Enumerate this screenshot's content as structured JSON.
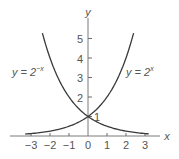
{
  "chart_data": {
    "type": "line",
    "title": "",
    "xlabel": "x",
    "ylabel": "y",
    "xlim": [
      -3.6,
      3.8
    ],
    "ylim": [
      0,
      6.2
    ],
    "grid": false,
    "legend": "inline labels",
    "x_ticks": [
      "-3",
      "-2",
      "-1",
      "0",
      "1",
      "2",
      "3"
    ],
    "y_ticks": [
      "1",
      "2",
      "3",
      "4",
      "5"
    ],
    "series": [
      {
        "name": "y = 2^x",
        "label_base": "y = 2",
        "label_exp": "x",
        "x": [
          -3.3,
          -3,
          -2,
          -1,
          0,
          1,
          2,
          2.4
        ],
        "y": [
          0.102,
          0.125,
          0.25,
          0.5,
          1,
          2,
          4,
          5.28
        ]
      },
      {
        "name": "y = 2^-x",
        "label_base": "y = 2",
        "label_exp": "−x",
        "x": [
          -2.4,
          -2,
          -1,
          0,
          1,
          2,
          3,
          3.2
        ],
        "y": [
          5.28,
          4,
          2,
          1,
          0.5,
          0.25,
          0.125,
          0.109
        ]
      }
    ],
    "annotations": [
      {
        "text": "1",
        "x": 0,
        "y": 1,
        "note": "intersection point (0, 1)"
      }
    ]
  },
  "axis": {
    "x_label": "x",
    "y_label": "y",
    "x_tick_labels": [
      "−3",
      "−2",
      "−1",
      "0",
      "1",
      "2",
      "3"
    ],
    "y_tick_labels": [
      "1",
      "2",
      "3",
      "4",
      "5"
    ]
  },
  "labels": {
    "left_curve_base": "y = 2",
    "left_curve_exp": "−x",
    "right_curve_base": "y = 2",
    "right_curve_exp": "x",
    "intersection": "1"
  }
}
